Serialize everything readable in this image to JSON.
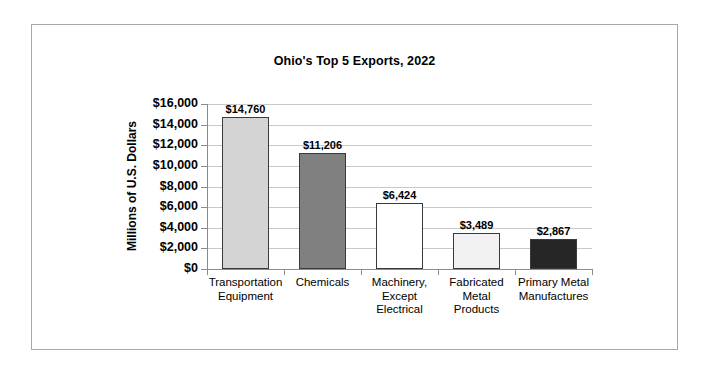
{
  "chart_data": {
    "type": "bar",
    "title": "Ohio's Top 5 Exports, 2022",
    "xlabel": "",
    "ylabel": "Millions of U.S. Dollars",
    "ylim": [
      0,
      16000
    ],
    "ytick_step": 2000,
    "grid": true,
    "legend": "none",
    "value_labels_shown": true,
    "categories": [
      "Transportation Equipment",
      "Chemicals",
      "Machinery, Except Electrical",
      "Fabricated Metal Products",
      "Primary Metal Manufactures"
    ],
    "values": [
      14760,
      11206,
      6424,
      3489,
      2867
    ],
    "value_labels": [
      "$14,760",
      "$11,206",
      "$6,424",
      "$3,489",
      "$2,867"
    ],
    "ytick_labels": [
      "$16,000",
      "$14,000",
      "$12,000",
      "$10,000",
      "$8,000",
      "$6,000",
      "$4,000",
      "$2,000",
      "$0"
    ],
    "ytick_values": [
      16000,
      14000,
      12000,
      10000,
      8000,
      6000,
      4000,
      2000,
      0
    ],
    "bar_colors": [
      "#d4d4d4",
      "#808080",
      "#ffffff",
      "#f2f2f2",
      "#262626"
    ],
    "bar_border_color": "#3a3a3a",
    "gridline_color": "#c9c9c9",
    "axis_color": "#8c8c8c",
    "frame_color": "#a8a8a8",
    "background_color": "#ffffff",
    "category_label_lines": [
      [
        "Transportation",
        "Equipment"
      ],
      [
        "Chemicals"
      ],
      [
        "Machinery,",
        "Except",
        "Electrical"
      ],
      [
        "Fabricated",
        "Metal",
        "Products"
      ],
      [
        "Primary Metal",
        "Manufactures"
      ]
    ]
  }
}
